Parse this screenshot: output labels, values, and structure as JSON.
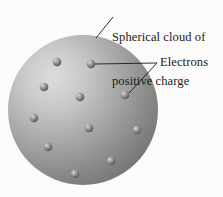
{
  "figure": {
    "background_color": "#fbfbf9"
  },
  "labels": {
    "cloud": {
      "line1": "Spherical cloud of",
      "line2": "positive charge"
    },
    "electrons": "Electrons"
  },
  "sphere": {
    "name": "positive-charge-cloud",
    "cx": 83,
    "cy": 110,
    "r": 75,
    "highlight_cx": 50,
    "highlight_cy": 78,
    "color_light": "#d2d2d0",
    "color_mid": "#9c9c9a",
    "color_dark": "#6c6c6b",
    "color_edge": "#5e5e5d"
  },
  "electrons": {
    "count": 11,
    "radius": 4.2,
    "color_light": "#c9c9c7",
    "color_mid": "#8a8a88",
    "color_dark": "#4a4a49",
    "positions": [
      {
        "cx": 57,
        "cy": 62
      },
      {
        "cx": 91,
        "cy": 64
      },
      {
        "cx": 44,
        "cy": 87
      },
      {
        "cx": 80,
        "cy": 97
      },
      {
        "cx": 125,
        "cy": 95
      },
      {
        "cx": 34,
        "cy": 118
      },
      {
        "cx": 89,
        "cy": 128
      },
      {
        "cx": 137,
        "cy": 130
      },
      {
        "cx": 48,
        "cy": 147
      },
      {
        "cx": 111,
        "cy": 161
      },
      {
        "cx": 75,
        "cy": 174
      }
    ]
  },
  "leader_lines": {
    "color": "#1a1a1a",
    "width": 0.9,
    "cloud": {
      "x1": 96,
      "y1": 38,
      "x2": 113,
      "y2": 17
    },
    "electrons_junction": {
      "x": 157,
      "y": 63
    },
    "electron_a": {
      "x1": 95,
      "y1": 64,
      "x2": 157,
      "y2": 63
    },
    "electron_b": {
      "x1": 129,
      "y1": 93,
      "x2": 157,
      "y2": 63
    }
  }
}
